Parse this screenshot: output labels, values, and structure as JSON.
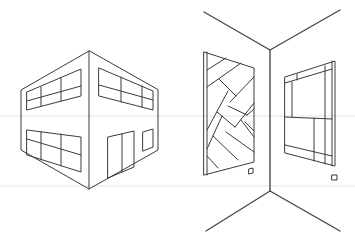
{
  "illustration": {
    "subject": "perspective line drawings",
    "left_figure": "building-two-point-perspective",
    "right_figure": "room-corner-with-wall-panels",
    "stroke_color": "#3a3a3a",
    "background_color": "#ffffff",
    "guide_line_color": "#e6e6e6"
  }
}
